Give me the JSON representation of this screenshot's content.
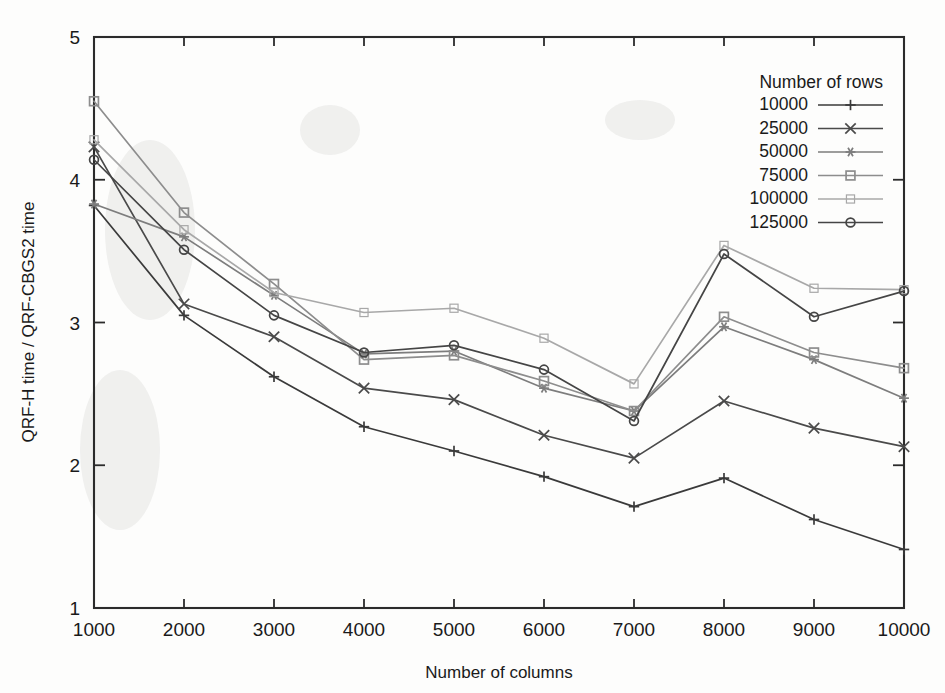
{
  "figure": {
    "background_color": "#fdfdfc",
    "axis_color": "#2b2b2b"
  },
  "axes": {
    "x_title": "Number of columns",
    "y_title": "QRF-H time / QRF-CBGS2 time",
    "x_ticks": [
      "1000",
      "2000",
      "3000",
      "4000",
      "5000",
      "6000",
      "7000",
      "8000",
      "9000",
      "10000"
    ],
    "y_ticks": [
      "1",
      "2",
      "3",
      "4",
      "5"
    ]
  },
  "legend": {
    "title": "Number of rows",
    "entries": [
      {
        "label": "10000",
        "marker": "plus-icon",
        "color": "#3a3a3a"
      },
      {
        "label": "25000",
        "marker": "cross-icon",
        "color": "#4a4a4a"
      },
      {
        "label": "50000",
        "marker": "asterisk-icon",
        "color": "#7d7d7d"
      },
      {
        "label": "75000",
        "marker": "open-square-icon",
        "color": "#8d8d8d"
      },
      {
        "label": "100000",
        "marker": "filled-square-icon",
        "color": "#a8a8a8"
      },
      {
        "label": "125000",
        "marker": "open-circle-icon",
        "color": "#454545"
      }
    ]
  },
  "chart_data": {
    "type": "line",
    "title": "",
    "xlabel": "Number of columns",
    "ylabel": "QRF-H time / QRF-CBGS2 time",
    "xlim": [
      1000,
      10000
    ],
    "ylim": [
      1,
      5
    ],
    "grid": false,
    "legend_position": "top-right",
    "legend_title": "Number of rows",
    "x": [
      1000,
      2000,
      3000,
      4000,
      5000,
      6000,
      7000,
      8000,
      9000,
      10000
    ],
    "series": [
      {
        "name": "10000",
        "marker": "plus",
        "color": "#3a3a3a",
        "values": [
          3.82,
          3.05,
          2.62,
          2.27,
          2.1,
          1.92,
          1.71,
          1.91,
          1.62,
          1.41
        ]
      },
      {
        "name": "25000",
        "marker": "cross",
        "color": "#4a4a4a",
        "values": [
          4.23,
          3.13,
          2.9,
          2.54,
          2.46,
          2.21,
          2.05,
          2.45,
          2.26,
          2.13
        ]
      },
      {
        "name": "50000",
        "marker": "asterisk",
        "color": "#7d7d7d",
        "values": [
          3.83,
          3.6,
          3.19,
          2.78,
          2.8,
          2.54,
          2.38,
          2.97,
          2.74,
          2.47
        ]
      },
      {
        "name": "75000",
        "marker": "open-square",
        "color": "#8d8d8d",
        "values": [
          4.55,
          3.77,
          3.27,
          2.74,
          2.77,
          2.59,
          2.38,
          3.04,
          2.79,
          2.68
        ]
      },
      {
        "name": "100000",
        "marker": "filled-square",
        "color": "#a8a8a8",
        "values": [
          4.28,
          3.65,
          3.21,
          3.07,
          3.1,
          2.89,
          2.57,
          3.54,
          3.24,
          3.23
        ]
      },
      {
        "name": "125000",
        "marker": "open-circle",
        "color": "#454545",
        "values": [
          4.14,
          3.51,
          3.05,
          2.79,
          2.84,
          2.67,
          2.31,
          3.48,
          3.04,
          3.22
        ]
      }
    ]
  }
}
